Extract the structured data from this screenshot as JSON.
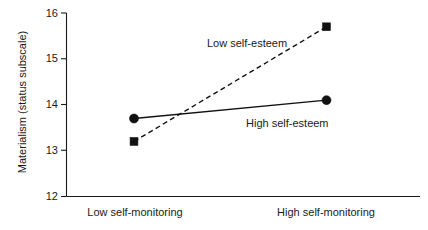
{
  "chart_data": {
    "type": "line",
    "title": "",
    "xlabel": "",
    "ylabel": "Materialism (status subscale)",
    "categories": [
      "Low self-monitoring",
      "High self-monitoring"
    ],
    "series": [
      {
        "name": "Low self-esteem",
        "values": [
          13.2,
          15.7
        ],
        "line_style": "dashed",
        "marker": "square"
      },
      {
        "name": "High self-esteem",
        "values": [
          13.7,
          14.1
        ],
        "line_style": "solid",
        "marker": "circle"
      }
    ],
    "ylim": [
      12,
      16
    ],
    "yticks": [
      12,
      13,
      14,
      15,
      16
    ],
    "ytick_labels": [
      "12",
      "13",
      "14",
      "15",
      "16"
    ],
    "grid": false,
    "legend_position": "inline-annotations",
    "annotations": [
      {
        "text": "Low self-esteem",
        "series": "Low self-esteem"
      },
      {
        "text": "High self-esteem",
        "series": "High self-esteem"
      }
    ],
    "colors": {
      "ink": "#111111",
      "axis": "#1a1a1a",
      "background": "#ffffff"
    }
  },
  "axis": {
    "y_title": "Materialism (status subscale)",
    "y_tick_0": "12",
    "y_tick_1": "13",
    "y_tick_2": "14",
    "y_tick_3": "15",
    "y_tick_4": "16",
    "x_cat_0": "Low self-monitoring",
    "x_cat_1": "High self-monitoring"
  },
  "annotations": {
    "low_self_esteem": "Low self-esteem",
    "high_self_esteem": "High self-esteem"
  }
}
